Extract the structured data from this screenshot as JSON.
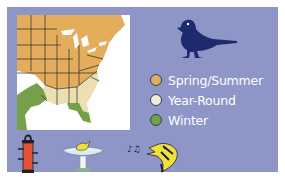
{
  "range_map": {
    "region": "Eastern United States",
    "colors": {
      "spring_summer": "#e3ad5c",
      "year_round": "#ece0b2",
      "winter": "#74a04a",
      "water": "#ffffff",
      "borders": "#2a2a2a"
    }
  },
  "bird": {
    "icon": "bird-silhouette-icon",
    "color": "#1e2a6e"
  },
  "legend": {
    "items": [
      {
        "label": "Spring/Summer",
        "color": "#e3ad5c"
      },
      {
        "label": "Year-Round",
        "color": "#f2edd6"
      },
      {
        "label": "Winter",
        "color": "#74a04a"
      }
    ]
  },
  "habit_icons": [
    {
      "name": "tube-feeder-icon",
      "color": "#e0533a"
    },
    {
      "name": "birdbath-icon",
      "color": "#e8f0f0"
    },
    {
      "name": "singing-bird-icon",
      "color": "#f1e23a"
    }
  ],
  "panel": {
    "background": "#8e95c7"
  }
}
